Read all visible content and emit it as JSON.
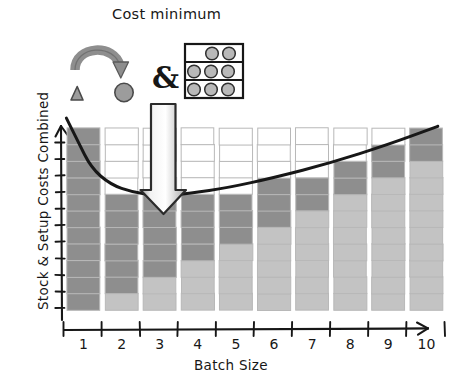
{
  "title": "Cost minimum",
  "axes": {
    "x": {
      "label": "Batch Size",
      "ticks": [
        "1",
        "2",
        "3",
        "4",
        "5",
        "6",
        "7",
        "8",
        "9",
        "10"
      ]
    },
    "y": {
      "label": "Stock & Setup Costs Combined",
      "tick_count": 11
    }
  },
  "icons": {
    "triangle": "triangle-shape-icon",
    "changeover_arrow": "curved-changeover-arrow-icon",
    "circle": "circle-shape-icon",
    "ampersand": "&",
    "storage_rack": "storage-rack-with-units-icon",
    "minimum_pointer": "down-arrow-pointer-icon"
  },
  "colors": {
    "ink": "#171717",
    "setup_cost": "#8e8e8e",
    "stock_cost": "#c3c3c3",
    "empty_cell": "#ffffff",
    "cell_border": "#b8b8b8",
    "arrow_fill": "#d9d9d9",
    "icon_gray": "#8e8e8e"
  },
  "chart_data": {
    "type": "bar",
    "title": "Cost minimum",
    "xlabel": "Batch Size",
    "ylabel": "Stock & Setup Costs Combined",
    "categories": [
      "1",
      "2",
      "3",
      "4",
      "5",
      "6",
      "7",
      "8",
      "9",
      "10"
    ],
    "unit_cells_per_bar": 11,
    "grid": true,
    "legend": null,
    "ylim": [
      0,
      11
    ],
    "series": [
      {
        "name": "Setup Costs",
        "color": "#8e8e8e",
        "values": [
          11,
          6,
          5,
          4,
          3,
          3,
          2,
          2,
          2,
          2
        ]
      },
      {
        "name": "Stock Costs",
        "color": "#c3c3c3",
        "values": [
          0,
          1,
          2,
          3,
          4,
          5,
          6,
          7,
          8,
          9
        ]
      }
    ],
    "totals": [
      11,
      7,
      7,
      7,
      7,
      8,
      8,
      9,
      10,
      11
    ],
    "cost_curve": {
      "type": "line",
      "label": "Total cost curve",
      "minimum_at_category": "3",
      "points": [
        {
          "x": 0.55,
          "y": 11.6
        },
        {
          "x": 0.85,
          "y": 10.2
        },
        {
          "x": 1.2,
          "y": 8.6
        },
        {
          "x": 1.7,
          "y": 7.6
        },
        {
          "x": 2.3,
          "y": 7.1
        },
        {
          "x": 3.0,
          "y": 6.9
        },
        {
          "x": 3.8,
          "y": 7.05
        },
        {
          "x": 4.8,
          "y": 7.4
        },
        {
          "x": 6.0,
          "y": 8.0
        },
        {
          "x": 7.5,
          "y": 8.9
        },
        {
          "x": 9.0,
          "y": 10.0
        },
        {
          "x": 10.3,
          "y": 11.1
        }
      ]
    },
    "annotations": [
      {
        "name": "cost-minimum-label",
        "text": "Cost minimum",
        "points_to_category": "3"
      },
      {
        "name": "minimum-arrow",
        "text": "",
        "points_to_category": "3"
      }
    ]
  }
}
